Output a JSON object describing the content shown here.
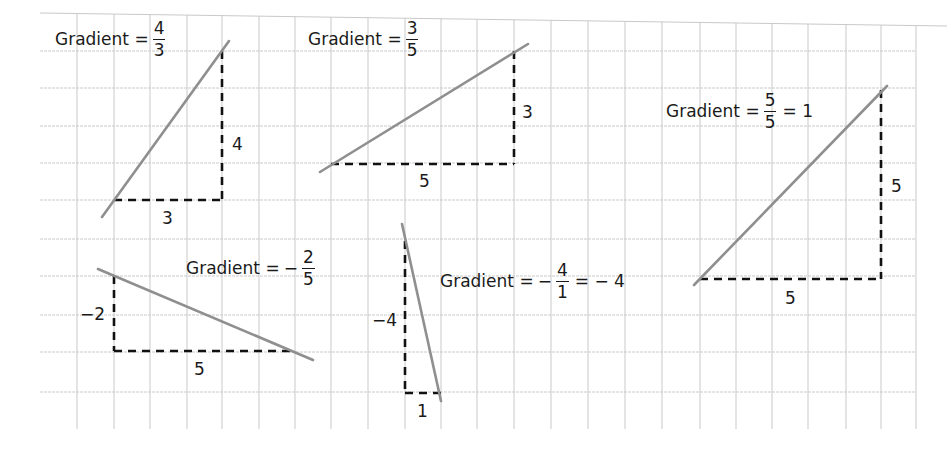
{
  "figure": {
    "grid": {
      "color": "#c9c9c9",
      "cell_px": 36.8,
      "vertical_x": [
        77,
        114,
        150,
        187,
        222,
        259,
        295,
        331,
        368,
        405,
        441,
        477,
        514,
        551,
        588,
        625,
        662,
        700,
        736,
        772,
        808,
        846,
        881,
        916
      ],
      "horizontal_y": [
        51,
        88,
        126,
        163,
        200,
        239,
        276,
        315,
        352,
        392
      ],
      "top_edge": {
        "x1": 40,
        "y1": 13,
        "x2": 947,
        "y2": 26
      },
      "left_x": 40,
      "right_x": 916,
      "bottom_y": 429
    },
    "colors": {
      "line": "#8f8f8f",
      "dash": "#111111",
      "text": "#1a1a1a"
    },
    "examples": [
      {
        "id": "ex1",
        "gradient_label": "Gradient =",
        "numerator": "4",
        "denominator": "3",
        "negative": false,
        "result": "",
        "line": {
          "x1": 102,
          "y1": 217,
          "x2": 229,
          "y2": 41
        },
        "rise_dash": {
          "x1": 222,
          "y1": 51,
          "x2": 222,
          "y2": 200
        },
        "run_dash": {
          "x1": 114,
          "y1": 200,
          "x2": 222,
          "y2": 200
        },
        "rise_label": "4",
        "run_label": "3",
        "label_pos": {
          "x": 55,
          "y": 48
        },
        "rise_label_pos": {
          "x": 232,
          "y": 136
        },
        "run_label_pos": {
          "x": 162,
          "y": 210
        }
      },
      {
        "id": "ex2",
        "gradient_label": "Gradient =",
        "numerator": "3",
        "denominator": "5",
        "negative": false,
        "result": "",
        "line": {
          "x1": 320,
          "y1": 172,
          "x2": 528,
          "y2": 44
        },
        "rise_dash": {
          "x1": 514,
          "y1": 51,
          "x2": 514,
          "y2": 164
        },
        "run_dash": {
          "x1": 331,
          "y1": 164,
          "x2": 514,
          "y2": 164
        },
        "rise_label": "3",
        "run_label": "5",
        "label_pos": {
          "x": 308,
          "y": 48
        },
        "rise_label_pos": {
          "x": 522,
          "y": 104
        },
        "run_label_pos": {
          "x": 419,
          "y": 173
        }
      },
      {
        "id": "ex3",
        "gradient_label": "Gradient =",
        "numerator": "5",
        "denominator": "5",
        "negative": false,
        "result": "= 1",
        "line": {
          "x1": 694,
          "y1": 285,
          "x2": 887,
          "y2": 86
        },
        "rise_dash": {
          "x1": 881,
          "y1": 90,
          "x2": 881,
          "y2": 279
        },
        "run_dash": {
          "x1": 700,
          "y1": 279,
          "x2": 881,
          "y2": 279
        },
        "rise_label": "5",
        "run_label": "5",
        "label_pos": {
          "x": 666,
          "y": 120
        },
        "rise_label_pos": {
          "x": 891,
          "y": 178
        },
        "run_label_pos": {
          "x": 785,
          "y": 290
        }
      },
      {
        "id": "ex4",
        "gradient_label": "Gradient =",
        "numerator": "2",
        "denominator": "5",
        "negative": true,
        "result": "",
        "line": {
          "x1": 98,
          "y1": 269,
          "x2": 313,
          "y2": 360
        },
        "rise_dash": {
          "x1": 114,
          "y1": 276,
          "x2": 114,
          "y2": 351
        },
        "run_dash": {
          "x1": 114,
          "y1": 351,
          "x2": 295,
          "y2": 351
        },
        "rise_label": "−2",
        "run_label": "5",
        "label_pos": {
          "x": 186,
          "y": 277
        },
        "rise_label_pos": {
          "x": 80,
          "y": 306
        },
        "run_label_pos": {
          "x": 194,
          "y": 361
        }
      },
      {
        "id": "ex5",
        "gradient_label": "Gradient =",
        "numerator": "4",
        "denominator": "1",
        "negative": true,
        "result": "= − 4",
        "line": {
          "x1": 402,
          "y1": 224,
          "x2": 441,
          "y2": 401
        },
        "rise_dash": {
          "x1": 405,
          "y1": 241,
          "x2": 405,
          "y2": 393
        },
        "run_dash": {
          "x1": 405,
          "y1": 393,
          "x2": 441,
          "y2": 393
        },
        "rise_label": "−4",
        "run_label": "1",
        "label_pos": {
          "x": 440,
          "y": 290
        },
        "rise_label_pos": {
          "x": 372,
          "y": 312
        },
        "run_label_pos": {
          "x": 417,
          "y": 403
        }
      }
    ]
  }
}
